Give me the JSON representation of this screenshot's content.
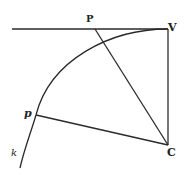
{
  "diagram": {
    "type": "geometric-figure",
    "stroke_color": "#2a2a2a",
    "labels": {
      "P": "P",
      "V": "V",
      "p": "p",
      "C": "C",
      "k": "k"
    },
    "points": {
      "V": [
        168,
        29
      ],
      "C": [
        168,
        145
      ],
      "P": [
        95,
        29
      ],
      "p": [
        36,
        115
      ]
    },
    "segments": [
      {
        "from": "line-start",
        "to": "V",
        "desc": "tangent line through V"
      },
      {
        "from": "V",
        "to": "C"
      },
      {
        "from": "P",
        "to": "C"
      },
      {
        "from": "p",
        "to": "C"
      }
    ],
    "curve": {
      "name": "k",
      "desc": "arc from V through p"
    }
  }
}
